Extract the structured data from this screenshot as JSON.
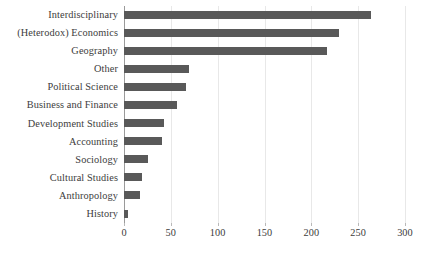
{
  "chart_data": {
    "type": "bar",
    "orientation": "horizontal",
    "title": "",
    "subtitle": "",
    "xlabel": "",
    "ylabel": "",
    "xlim": [
      0,
      300
    ],
    "xticks": [
      0,
      50,
      100,
      150,
      200,
      250,
      300
    ],
    "xtick_labels": [
      "0",
      "50",
      "100",
      "150",
      "200",
      "250",
      "300"
    ],
    "grid": true,
    "grid_axis": "x",
    "legend": false,
    "legend_position": "none",
    "bar_color": "#595959",
    "gridline_color": "#e8e8e8",
    "axis_color": "#9a9a9a",
    "text_color": "#3c3c3c",
    "categories": [
      "Interdisciplinary",
      "(Heterodox) Economics",
      "Geography",
      "Other",
      "Political Science",
      "Business and Finance",
      "Development Studies",
      "Accounting",
      "Sociology",
      "Cultural Studies",
      "Anthropology",
      "History"
    ],
    "values": [
      264,
      230,
      217,
      69,
      66,
      57,
      43,
      41,
      26,
      19,
      17,
      4
    ]
  }
}
